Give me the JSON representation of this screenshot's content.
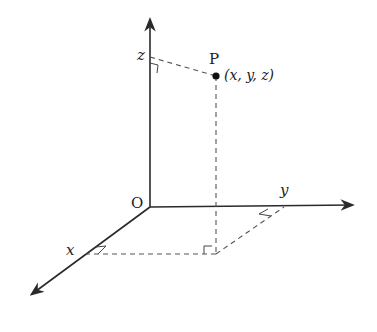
{
  "diagram": {
    "labels": {
      "origin": "O",
      "x_axis": "x",
      "y_axis": "y",
      "z_axis": "z",
      "point": "P",
      "coordinates": "(x, y, z)"
    },
    "colors": {
      "axis": "#2a2a2a",
      "dashed": "#555555",
      "point": "#111111"
    }
  }
}
